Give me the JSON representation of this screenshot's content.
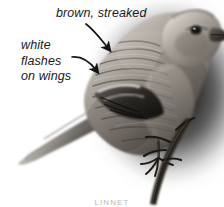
{
  "figure": {
    "kind": "annotated-photograph",
    "rendering": "grayscale photograph",
    "background_color": "#ffffff",
    "text_color": "#18191a",
    "vignette_color": "#2b2b2b"
  },
  "annotations": [
    {
      "id": "brown-streaked",
      "text": "brown, streaked",
      "points_to": "back and upperparts",
      "arrow": "curved-down-right"
    },
    {
      "id": "white-flashes",
      "line1": "white",
      "line2": "flashes",
      "line3": "on wings",
      "points_to": "wing panel",
      "arrow": "curved-down-right"
    }
  ],
  "caption": {
    "text": "LINNET"
  },
  "bird": {
    "eye_color": "#141414",
    "bill_color": "#2a2724",
    "plumage_light": "#c9c4bd",
    "plumage_mid": "#8d877f",
    "plumage_dark": "#4a4541",
    "wing_dark": "#1e1c1a",
    "wing_flash": "#f2f0ec",
    "perch_color": "#23211e"
  }
}
